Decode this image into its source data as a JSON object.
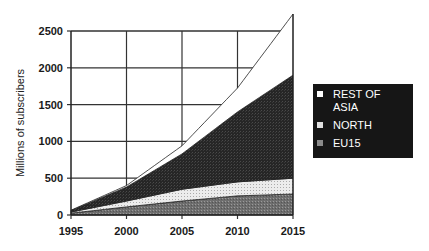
{
  "chart_data": {
    "type": "area",
    "stacked": true,
    "title": "",
    "xlabel": "",
    "ylabel": "Millions of subscribers",
    "x": [
      1995,
      2000,
      2005,
      2010,
      2015
    ],
    "xticks": [
      "1995",
      "2000",
      "2005",
      "2010",
      "2015"
    ],
    "yticks": [
      "0",
      "500",
      "1000",
      "1500",
      "2000",
      "2500"
    ],
    "ylim": [
      0,
      2500
    ],
    "grid": true,
    "legend_position": "right",
    "series": [
      {
        "name": "EU15",
        "values": [
          25,
          110,
          190,
          260,
          285
        ],
        "fill": "#7a7a7a"
      },
      {
        "name": "NORTH",
        "values": [
          15,
          80,
          160,
          190,
          215
        ],
        "fill": "#e4e4e4"
      },
      {
        "name": "REST OF ASIA",
        "values": [
          20,
          190,
          480,
          950,
          1400
        ],
        "fill": "#2b2b2b"
      },
      {
        "name": "(top unlabeled band)",
        "values": [
          5,
          20,
          110,
          325,
          830
        ],
        "fill": "#ffffff"
      }
    ],
    "totals": [
      65,
      400,
      940,
      1725,
      2730
    ]
  },
  "legend": {
    "items": [
      {
        "label_line1": "REST OF",
        "label_line2": "ASIA",
        "color": "#ffffff"
      },
      {
        "label": "NORTH",
        "color": "#e0e0e0"
      },
      {
        "label": "EU15",
        "color": "#8a8a8a"
      }
    ]
  }
}
